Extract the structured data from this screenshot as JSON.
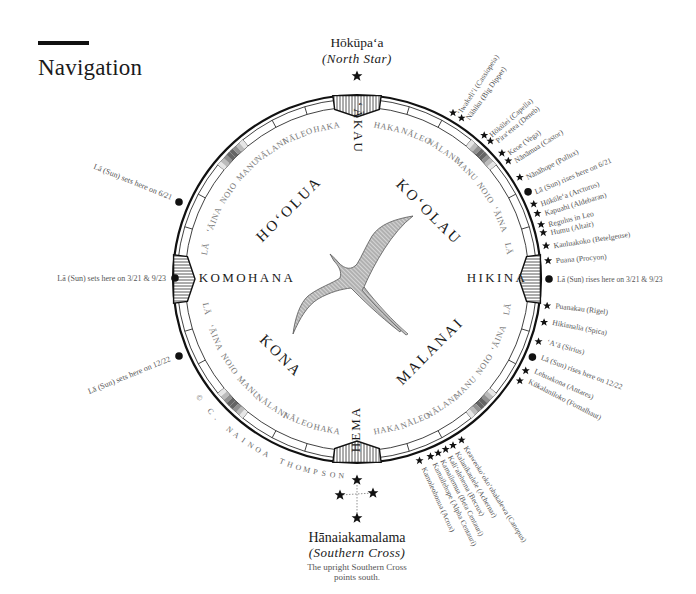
{
  "page": {
    "title": "Navigation"
  },
  "compass": {
    "center": [
      357,
      279
    ],
    "outer_radius": 184,
    "houses_per_quadrant_side": [
      "LĀ",
      "ʻĀINA",
      "NOIO",
      "MANU",
      "NĀLANI",
      "NĀLEO",
      "HAKA"
    ],
    "cardinals": {
      "north": "ʻĀKAU",
      "south": "HEMA",
      "east": "HIKINA",
      "west": "KOMOHANA"
    },
    "quadrants": {
      "ne": "KOʻOLAU",
      "nw": "HOʻOLUA",
      "se": "MALANAI",
      "sw": "KONA"
    },
    "copyright": "© C. NAINOA THOMPSON"
  },
  "north_star": {
    "name": "Hōkūpaʻa",
    "english": "(North Star)"
  },
  "southern_cross": {
    "name": "Hānaiakamalama",
    "english": "(Southern Cross)",
    "note_line1": "The upright Southern Cross",
    "note_line2": "points south."
  },
  "sun_west": {
    "summer": "Lā (Sun) sets here on 6/21",
    "equinox": "Lā (Sun) sets here on 3/21 & 9/23",
    "winter": "Lā (Sun) sets here on 12/22"
  },
  "stars_ne": [
    {
      "label": "ʻIwakeliʻi (Cassiopeia)",
      "kind": "star"
    },
    {
      "label": "Nāhiku (Big Dipper)",
      "kind": "star"
    },
    {
      "label": "Hōkūlei (Capella)",
      "kind": "star"
    },
    {
      "label": "Piraʻetea (Deneb)",
      "kind": "star"
    },
    {
      "label": "Keoe (Vega)",
      "kind": "star"
    },
    {
      "label": "Nānāmua (Castor)",
      "kind": "star"
    },
    {
      "label": "Nānāhope (Pollux)",
      "kind": "star"
    },
    {
      "label": "Lā (Sun) rises here on 6/21",
      "kind": "sun"
    },
    {
      "label": "Hōkūleʻa (Arcturus)",
      "kind": "star"
    },
    {
      "label": "Kapuahi (Aldebaran)",
      "kind": "star"
    },
    {
      "label": "Regulus in Leo",
      "kind": "star"
    },
    {
      "label": "Humu (Altair)",
      "kind": "star"
    },
    {
      "label": "Kauluakoko (Betelgeuse)",
      "kind": "star"
    },
    {
      "label": "Puana (Procyon)",
      "kind": "star"
    }
  ],
  "sun_east_equinox": "Lā (Sun) rises here on 3/21 & 9/23",
  "stars_se": [
    {
      "label": "Puanakau (Rigel)",
      "kind": "star"
    },
    {
      "label": "Hikianalia (Spica)",
      "kind": "star"
    },
    {
      "label": "ʻAʻā (Sirius)",
      "kind": "star"
    },
    {
      "label": "Lā (Sun) rises here on 12/22",
      "kind": "sun"
    },
    {
      "label": "Lehuakona (Antares)",
      "kind": "star"
    },
    {
      "label": "Kūkalaniloko (Fomalhaut)",
      "kind": "star"
    }
  ],
  "stars_south": [
    {
      "label": "Keaweokoʻokoʻohakalewa (Canopus)",
      "kind": "star"
    },
    {
      "label": "Kalanikaulele (Achernar)",
      "kind": "star"
    },
    {
      "label": "Kaliʻalehema (Becrux)",
      "kind": "star"
    },
    {
      "label": "Kamailemua (Beta Centauri)",
      "kind": "star"
    },
    {
      "label": "Kamailehope (Alpha Centauri)",
      "kind": "star"
    },
    {
      "label": "Kamoleohonua (Acrux)",
      "kind": "star"
    }
  ],
  "colors": {
    "ink": "#1a1a1a",
    "muted_text": "#6b6b6b",
    "hatch_fill": "#9a9a9a",
    "background": "#ffffff"
  }
}
